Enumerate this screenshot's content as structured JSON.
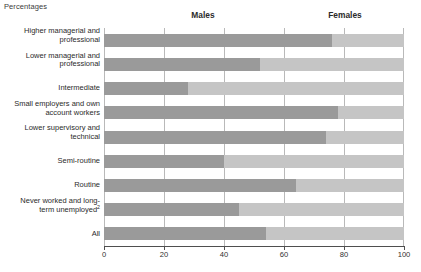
{
  "units_label": "Percentages",
  "colors": {
    "males": "#9a9a9a",
    "females": "#c5c5c5",
    "gridline": "#b9b9b9",
    "axis": "#4f4f4f",
    "text": "#2b2b2b"
  },
  "headers": {
    "males": "Males",
    "females": "Females"
  },
  "footnote": "",
  "chart_data": {
    "type": "bar",
    "title": "",
    "subtitle": "",
    "xlabel": "",
    "ylabel": "",
    "unit": "Percentages",
    "orientation": "horizontal",
    "stacked": true,
    "stack_total": 100,
    "grid": true,
    "legend_position": "top",
    "xlim": [
      0,
      100
    ],
    "xticks": [
      0,
      20,
      40,
      60,
      80,
      100
    ],
    "xtick_labels": [
      "0",
      "20",
      "40",
      "60",
      "80",
      "100"
    ],
    "categories": [
      "Higher managerial and\nprofessional",
      "Lower managerial and\nprofessional",
      "Intermediate",
      "Small employers and own\naccount workers",
      "Lower supervisory and\ntechnical",
      "Semi-routine",
      "Routine",
      "Never worked and long-\nterm unemployed²",
      "All"
    ],
    "series": [
      {
        "name": "Males",
        "color": "#9a9a9a",
        "values": [
          76,
          52,
          28,
          78,
          74,
          40,
          64,
          45,
          54
        ]
      },
      {
        "name": "Females",
        "color": "#c5c5c5",
        "values": [
          24,
          48,
          72,
          22,
          26,
          60,
          36,
          55,
          46
        ]
      }
    ]
  }
}
